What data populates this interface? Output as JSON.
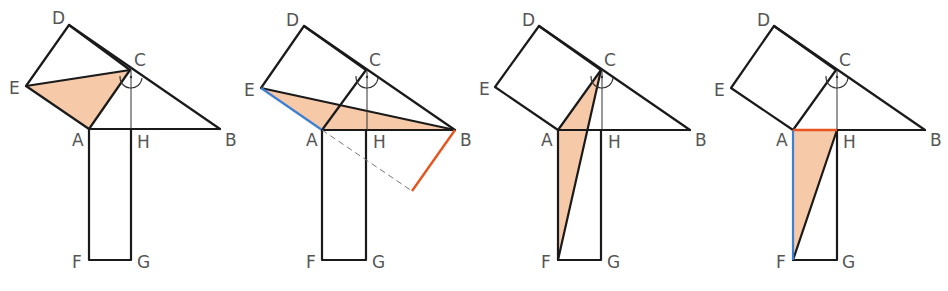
{
  "figure": {
    "colors": {
      "shade": "#f6c9a9",
      "line": "#1a1a1a",
      "blue_highlight": "#3d7fd0",
      "orange_highlight": "#e8541e",
      "label": "#555555"
    },
    "panels": [
      {
        "id": 1,
        "labels": {
          "D": "D",
          "C": "C",
          "E": "E",
          "A": "A",
          "H": "H",
          "B": "B",
          "F": "F",
          "G": "G"
        },
        "shaded": "triangle E-A-C"
      },
      {
        "id": 2,
        "labels": {
          "D": "D",
          "C": "C",
          "E": "E",
          "A": "A",
          "H": "H",
          "B": "B",
          "F": "F",
          "G": "G"
        },
        "shaded": "triangle E-A-B",
        "highlights": [
          "E-A blue",
          "B-perpendicular orange",
          "A dashed extension"
        ]
      },
      {
        "id": 3,
        "labels": {
          "D": "D",
          "C": "C",
          "E": "E",
          "A": "A",
          "H": "H",
          "B": "B",
          "F": "F",
          "G": "G"
        },
        "shaded": "triangle A-C-F"
      },
      {
        "id": 4,
        "labels": {
          "D": "D",
          "C": "C",
          "E": "E",
          "A": "A",
          "H": "H",
          "B": "B",
          "F": "F",
          "G": "G"
        },
        "shaded": "triangle A-H-F",
        "highlights": [
          "A-F blue",
          "A-H orange"
        ]
      }
    ]
  }
}
